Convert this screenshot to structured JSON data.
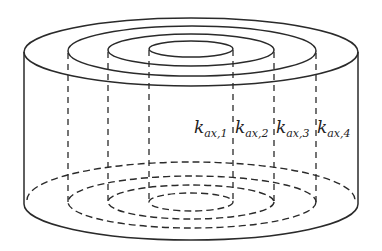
{
  "diagram": {
    "type": "concentric-cylinder-zones",
    "labels": [
      {
        "main": "k",
        "sub": "ax,1"
      },
      {
        "main": "k",
        "sub": "ax,2"
      },
      {
        "main": "k",
        "sub": "ax,3"
      },
      {
        "main": "k",
        "sub": "ax,4"
      }
    ],
    "colors": {
      "stroke": "#2a2a2a",
      "background": "#ffffff"
    }
  }
}
